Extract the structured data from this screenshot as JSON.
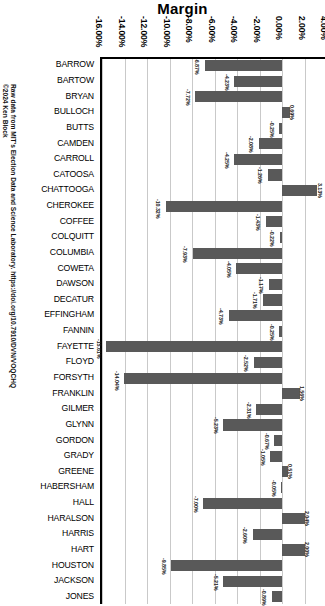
{
  "chart_data": {
    "type": "bar",
    "orientation": "horizontal",
    "title": "Margin",
    "xlabel": "",
    "ylabel": "",
    "xlim": [
      -16.0,
      4.0
    ],
    "xtick_step": 2.0,
    "xticks": [
      "-16.00%",
      "-14.00%",
      "-12.00%",
      "-10.00%",
      "-8.00%",
      "-6.00%",
      "-4.00%",
      "-2.00%",
      "0.00%",
      "2.00%",
      "4.00%"
    ],
    "xtick_values": [
      -16,
      -14,
      -12,
      -10,
      -8,
      -6,
      -4,
      -2,
      0,
      2,
      4
    ],
    "grid": true,
    "legend": null,
    "bar_color": "#595959",
    "categories": [
      "BARROW",
      "BARTOW",
      "BRYAN",
      "BULLOCH",
      "BUTTS",
      "CAMDEN",
      "CARROLL",
      "CATOOSA",
      "CHATTOOGA",
      "CHEROKEE",
      "COFFEE",
      "COLQUITT",
      "COLUMBIA",
      "COWETA",
      "DAWSON",
      "DECATUR",
      "EFFINGHAM",
      "FANNIN",
      "FAYETTE",
      "FLOYD",
      "FORSYTH",
      "FRANKLIN",
      "GILMER",
      "GLYNN",
      "GORDON",
      "GRADY",
      "GREENE",
      "HABERSHAM",
      "HALL",
      "HARALSON",
      "HARRIS",
      "HART",
      "HOUSTON",
      "JACKSON",
      "JONES"
    ],
    "values": [
      -6.87,
      -4.23,
      -7.72,
      0.69,
      -0.25,
      -2.08,
      -4.25,
      -1.26,
      3.13,
      -10.32,
      -1.43,
      -0.22,
      -7.93,
      -4.05,
      -1.17,
      -1.71,
      -4.73,
      -0.25,
      -15.61,
      -2.52,
      -14.04,
      1.56,
      -2.31,
      -5.23,
      -0.67,
      -1.05,
      0.51,
      -0.05,
      -7.0,
      2.04,
      -2.6,
      2.0,
      -9.85,
      -5.21,
      -0.89
    ],
    "value_labels": [
      "-6.87%",
      "-4.23%",
      "-7.72%",
      "0.69%",
      "-0.25%",
      "-2.08%",
      "-4.25%",
      "-1.26%",
      "3.13%",
      "-10.32%",
      "-1.43%",
      "-0.22%",
      "-7.93%",
      "-4.05%",
      "-1.17%",
      "-1.71%",
      "-4.73%",
      "-0.25%",
      "-15.61%",
      "-2.52%",
      "-14.04%",
      "1.56%",
      "-2.31%",
      "-5.23%",
      "-0.67%",
      "-1.05%",
      "0.51%",
      "-0.05%",
      "-7.00%",
      "2.04%",
      "-2.60%",
      "2.00%",
      "-9.85%",
      "-5.21%",
      "-0.89%"
    ]
  },
  "credit": {
    "source_line": "Raw data from MIT's Election Data and Science Laboratory. https://doi.org/10.7910/DVN/VOQCHQ",
    "copyright_line": "©2024 Ken Block"
  }
}
